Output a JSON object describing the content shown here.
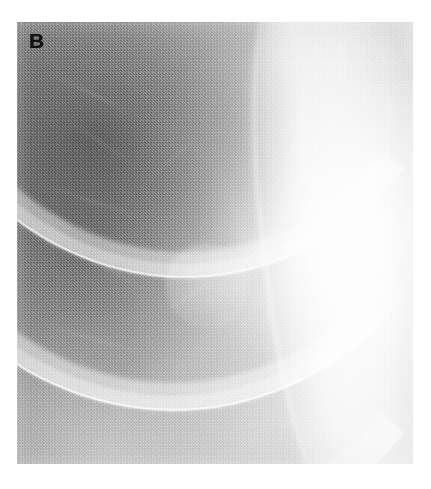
{
  "figure": {
    "panel_label": "B",
    "modality": "chest-radiograph",
    "view": "coned-down-right-upper-hemithorax",
    "background_color": "#ffffff",
    "plate": {
      "left": 17,
      "top": 22,
      "width": 396,
      "height": 442,
      "base_color": "#b9b9b9",
      "darkest_tone": "#5a5a5a",
      "brightest_tone": "#f2f2f2"
    },
    "label_style": {
      "color": "#111111",
      "size_px": 21,
      "weight": "bold",
      "left": 29,
      "top": 30
    }
  },
  "anatomy": {
    "ribs": [
      {
        "name": "rib-1",
        "label": "posterior rib band 1",
        "left": "-34%",
        "top": "-92%",
        "width": "150%",
        "height": "150%",
        "border_width": "26px",
        "rotate": "-5deg",
        "color": "rgba(255,255,255,.44)",
        "core_color": "rgba(255,255,255,.30)",
        "edge_color": "rgba(255,255,255,.78)"
      },
      {
        "name": "rib-2",
        "label": "posterior rib band 2",
        "left": "-40%",
        "top": "-64%",
        "width": "156%",
        "height": "152%",
        "border_width": "28px",
        "rotate": "-6deg",
        "color": "rgba(255,255,255,.46)",
        "core_color": "rgba(255,255,255,.32)",
        "edge_color": "rgba(255,255,255,.82)"
      },
      {
        "name": "rib-3",
        "label": "posterior rib band 3",
        "left": "-46%",
        "top": "-34%",
        "width": "162%",
        "height": "154%",
        "border_width": "30px",
        "rotate": "-6deg",
        "color": "rgba(255,255,255,.46)",
        "core_color": "rgba(255,255,255,.32)",
        "edge_color": "rgba(255,255,255,.80)"
      },
      {
        "name": "rib-4",
        "label": "posterior rib band 4",
        "left": "-52%",
        "top": "-2%",
        "width": "168%",
        "height": "156%",
        "border_width": "32px",
        "rotate": "-6deg",
        "color": "rgba(255,255,255,.44)",
        "core_color": "rgba(255,255,255,.30)",
        "edge_color": "rgba(255,255,255,.76)"
      },
      {
        "name": "rib-5",
        "label": "posterior rib band 5",
        "left": "-58%",
        "top": "32%",
        "width": "176%",
        "height": "158%",
        "border_width": "34px",
        "rotate": "-6deg",
        "color": "rgba(255,255,255,.40)",
        "core_color": "rgba(255,255,255,.26)",
        "edge_color": "rgba(255,255,255,.68)"
      },
      {
        "name": "rib-6",
        "label": "posterior rib band 6",
        "left": "-64%",
        "top": "66%",
        "width": "184%",
        "height": "160%",
        "border_width": "34px",
        "rotate": "-6deg",
        "color": "rgba(255,255,255,.34)",
        "core_color": "rgba(255,255,255,.20)",
        "edge_color": "rgba(255,255,255,.52)"
      },
      {
        "name": "rib-anterior-a",
        "label": "anterior rib band a",
        "left": "-18%",
        "top": "10%",
        "width": "120%",
        "height": "120%",
        "border_width": "16px",
        "rotate": "22deg",
        "color": "rgba(255,255,255,.20)",
        "core_color": "rgba(255,255,255,.12)",
        "edge_color": "rgba(255,255,255,.26)"
      },
      {
        "name": "rib-anterior-b",
        "label": "anterior rib band b",
        "left": "-24%",
        "top": "44%",
        "width": "128%",
        "height": "124%",
        "border_width": "16px",
        "rotate": "24deg",
        "color": "rgba(255,255,255,.18)",
        "core_color": "rgba(255,255,255,.10)",
        "edge_color": "rgba(255,255,255,.22)"
      }
    ],
    "vessels": [
      {
        "name": "vessel-1",
        "left": "6%",
        "top": "16%",
        "width": "26%",
        "height": "2.0px",
        "rotate": "26deg",
        "opacity": 0.55
      },
      {
        "name": "vessel-2",
        "left": "10%",
        "top": "27%",
        "width": "22%",
        "height": "1.8px",
        "rotate": "34deg",
        "opacity": 0.45
      },
      {
        "name": "vessel-3",
        "left": "3%",
        "top": "40%",
        "width": "30%",
        "height": "2.2px",
        "rotate": "18deg",
        "opacity": 0.5
      },
      {
        "name": "vessel-4",
        "left": "12%",
        "top": "56%",
        "width": "24%",
        "height": "1.8px",
        "rotate": "30deg",
        "opacity": 0.42
      },
      {
        "name": "vessel-5",
        "left": "4%",
        "top": "72%",
        "width": "34%",
        "height": "2.0px",
        "rotate": "16deg",
        "opacity": 0.46
      },
      {
        "name": "vessel-6",
        "left": "14%",
        "top": "86%",
        "width": "28%",
        "height": "2.0px",
        "rotate": "12deg",
        "opacity": 0.4
      },
      {
        "name": "vessel-7",
        "left": "30%",
        "top": "30%",
        "width": "20%",
        "height": "1.6px",
        "rotate": "-40deg",
        "opacity": 0.34
      },
      {
        "name": "vessel-8",
        "left": "34%",
        "top": "62%",
        "width": "18%",
        "height": "1.6px",
        "rotate": "-34deg",
        "opacity": 0.32
      }
    ],
    "nodule": {
      "name": "pulmonary-nodule",
      "label": "rounded nodular opacity",
      "center_x_pct": 47.5,
      "center_y_pct": 59.2,
      "diameter_pct": 19
    },
    "scapula": {
      "name": "scapular-axillary-band",
      "label": "vertical bright scapular / axillary soft-tissue band"
    }
  }
}
